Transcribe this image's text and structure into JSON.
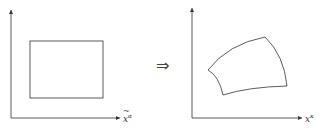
{
  "left_panel": {
    "axis_label_base": "x",
    "axis_label_sup": "α",
    "axis_label_accent": "tilde",
    "shape": "rectangle"
  },
  "transition": {
    "symbol": "⇒"
  },
  "right_panel": {
    "axis_label_base": "x",
    "axis_label_sup": "κ",
    "shape": "curved-quadrilateral"
  },
  "colors": {
    "stroke": "#333333",
    "background": "#ffffff"
  }
}
